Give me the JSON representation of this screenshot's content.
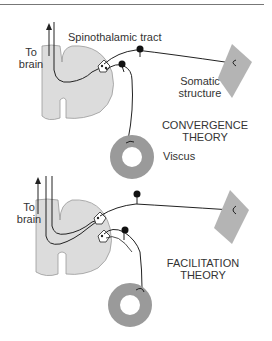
{
  "panels": [
    {
      "id": "convergence",
      "title_line1": "CONVERGENCE",
      "title_line2": "THEORY",
      "labels": {
        "tract": "Spinothalamic tract",
        "to": "To",
        "brain": "brain",
        "somatic1": "Somatic",
        "somatic2": "structure",
        "viscus": "Viscus"
      }
    },
    {
      "id": "facilitation",
      "title_line1": "FACILITATION",
      "title_line2": "THEORY",
      "labels": {
        "to": "To",
        "brain": "brain"
      }
    }
  ],
  "colors": {
    "spinal_cord": "#dcdcdc",
    "spinal_cord_outline": "#999999",
    "somatic_structure": "#b4b4b4",
    "viscus": "#9a9a9a",
    "nerve": "#222222"
  }
}
